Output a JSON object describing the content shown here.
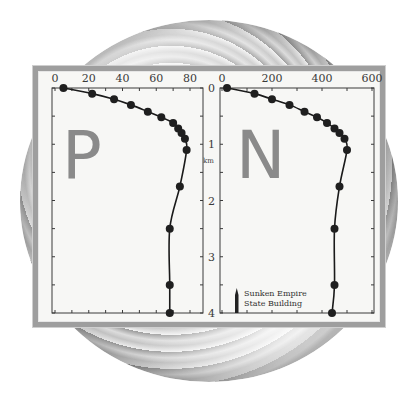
{
  "chart_data": [
    {
      "type": "line",
      "title": "P",
      "xlabel": "",
      "ylabel": "km",
      "xlim": [
        0,
        90
      ],
      "ylim": [
        4,
        0
      ],
      "x_ticks": [
        0,
        20,
        40,
        60,
        80
      ],
      "y_ticks": [
        0,
        1,
        2,
        3,
        4
      ],
      "grid": false,
      "markers": true,
      "series": [
        {
          "name": "P",
          "x": [
            5,
            22,
            35,
            45,
            55,
            63,
            70,
            73,
            75,
            77,
            78,
            74,
            68,
            68,
            68
          ],
          "y": [
            0,
            0.1,
            0.2,
            0.3,
            0.42,
            0.52,
            0.62,
            0.72,
            0.8,
            0.9,
            1.1,
            1.75,
            2.5,
            3.5,
            4.0
          ]
        }
      ]
    },
    {
      "type": "line",
      "title": "N",
      "xlabel": "",
      "ylabel": "km",
      "xlim": [
        0,
        600
      ],
      "ylim": [
        4,
        0
      ],
      "x_ticks": [
        0,
        200,
        400,
        600
      ],
      "y_ticks": [
        0,
        1,
        2,
        3,
        4
      ],
      "grid": false,
      "markers": true,
      "annotations": [
        "Sunken Empire",
        "State Building"
      ],
      "series": [
        {
          "name": "N",
          "x": [
            20,
            130,
            200,
            270,
            330,
            380,
            420,
            450,
            470,
            490,
            500,
            470,
            450,
            450,
            440
          ],
          "y": [
            0,
            0.1,
            0.2,
            0.3,
            0.42,
            0.52,
            0.62,
            0.72,
            0.8,
            0.9,
            1.1,
            1.75,
            2.5,
            3.5,
            4.0
          ]
        }
      ]
    }
  ],
  "labels": {
    "panel_p": "P",
    "panel_n": "N",
    "depth_unit": "km",
    "annotation_line1": "Sunken Empire",
    "annotation_line2": "State Building"
  },
  "colors": {
    "line": "#1a1a1a",
    "marker": "#1f1f1f",
    "letter": "#8a8a8a",
    "frame": "#3a3a3a",
    "panel_border": "#9e9e9e"
  }
}
